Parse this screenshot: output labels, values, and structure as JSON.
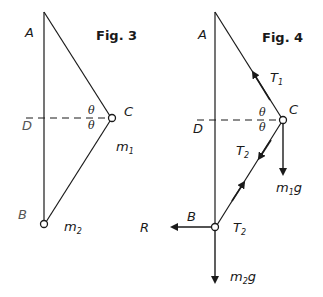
{
  "figures": [
    {
      "title": "Fig. 3",
      "points": {
        "A": "A",
        "B": "B",
        "C": "C",
        "D": "D"
      },
      "angles": [
        "θ",
        "θ"
      ],
      "masses": {
        "m1": {
          "base": "m",
          "sub": "1"
        },
        "m2": {
          "base": "m",
          "sub": "2"
        }
      }
    },
    {
      "title": "Fig. 4",
      "points": {
        "A": "A",
        "B": "B",
        "C": "C",
        "D": "D"
      },
      "angles": [
        "θ",
        "θ"
      ],
      "forces": {
        "T1": {
          "base": "T",
          "sub": "1"
        },
        "T2_upper": {
          "base": "T",
          "sub": "2"
        },
        "T2_lower": {
          "base": "T",
          "sub": "2"
        },
        "m1g": {
          "base": "m",
          "sub": "1",
          "tail": "g"
        },
        "m2g": {
          "base": "m",
          "sub": "2",
          "tail": "g"
        },
        "R": "R"
      }
    }
  ],
  "colors": {
    "ink": "#1a1a1a",
    "background": "#ffffff"
  }
}
